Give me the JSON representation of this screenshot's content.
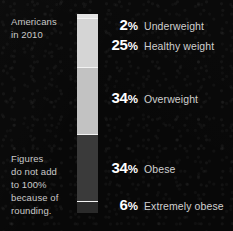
{
  "caption": {
    "top": "Americans\nin 2010",
    "note": "Figures\ndo not add\nto 100%\nbecause of\nrounding."
  },
  "colors": {
    "background": "#0a0a0a",
    "percent_text": "#ffffff",
    "category_text": "#cfcfcf",
    "caption_text": "#c9c9c9",
    "divider": "#f2f2f2"
  },
  "chart_data": {
    "type": "bar",
    "orientation": "vertical-stacked",
    "title": "Americans in 2010",
    "subtitle": "",
    "xlabel": "",
    "ylabel": "",
    "note": "Figures do not add to 100% because of rounding.",
    "grid": false,
    "legend_position": "right-inline",
    "total": 101,
    "unit": "%",
    "categories": [
      "Underweight",
      "Healthy weight",
      "Overweight",
      "Obese",
      "Extremely obese"
    ],
    "values": [
      2,
      25,
      34,
      34,
      6
    ],
    "segments": [
      {
        "label": "Underweight",
        "value": 2,
        "percent_text": "2",
        "percent_symbol": "%",
        "color": "#e4e4e4",
        "label_top_px": 16
      },
      {
        "label": "Healthy weight",
        "value": 25,
        "percent_text": "25",
        "percent_symbol": "%",
        "color": "#d5d5d5",
        "label_top_px": 36
      },
      {
        "label": "Overweight",
        "value": 34,
        "percent_text": "34",
        "percent_symbol": "%",
        "color": "#c2c2c2",
        "label_top_px": 89
      },
      {
        "label": "Obese",
        "value": 34,
        "percent_text": "34",
        "percent_symbol": "%",
        "color": "#3a3a3a",
        "label_top_px": 159
      },
      {
        "label": "Extremely obese",
        "value": 6,
        "percent_text": "6",
        "percent_symbol": "%",
        "color": "#2a2a2a",
        "label_top_px": 196
      }
    ]
  }
}
